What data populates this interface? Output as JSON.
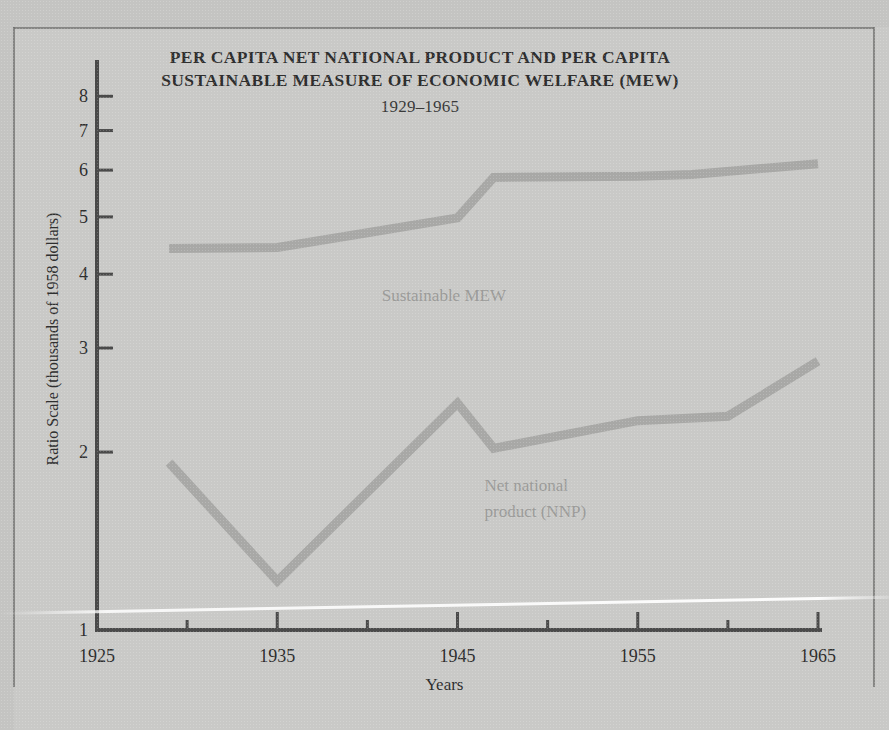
{
  "figure": {
    "title_line1": "PER CAPITA NET NATIONAL PRODUCT AND PER CAPITA",
    "title_line2": "SUSTAINABLE MEASURE OF ECONOMIC WELFARE (MEW)",
    "subtitle": "1929–1965",
    "xlabel": "Years",
    "ylabel": "Ratio Scale (thousands of 1958 dollars)",
    "background_color": "#c9c9c7",
    "axis_color": "#4a4a4a",
    "series_color": "#a8a8a6",
    "text_color": "#2e2e2e"
  },
  "chart_data": {
    "type": "line",
    "title": "PER CAPITA NET NATIONAL PRODUCT AND PER CAPITA SUSTAINABLE MEASURE OF ECONOMIC WELFARE (MEW) 1929–1965",
    "xlabel": "Years",
    "ylabel": "Ratio Scale (thousands of 1958 dollars)",
    "yscale": "log",
    "ylim": [
      1,
      9
    ],
    "xlim": [
      1925,
      1965
    ],
    "grid": false,
    "legend": "inline-annotations",
    "yticks": [
      1,
      2,
      3,
      4,
      5,
      6,
      7,
      8
    ],
    "ytick_labels": [
      "1",
      "2",
      "3",
      "4",
      "5",
      "6",
      "7",
      "8"
    ],
    "xticks": [
      1925,
      1930,
      1935,
      1940,
      1945,
      1950,
      1955,
      1960,
      1965
    ],
    "xtick_labels": [
      "1925",
      "",
      "1935",
      "",
      "1945",
      "",
      "1955",
      "",
      "1965"
    ],
    "xtick_labels_major": [
      "1925",
      "1935",
      "1945",
      "1955",
      "1965"
    ],
    "series": [
      {
        "name": "Sustainable MEW",
        "label_x": 1940.8,
        "label_y": 3.6,
        "x": [
          1929,
          1935,
          1940,
          1945,
          1947,
          1955,
          1958,
          1965
        ],
        "values": [
          4.42,
          4.44,
          4.7,
          4.98,
          5.83,
          5.86,
          5.9,
          6.15
        ]
      },
      {
        "name": "Net national product (NNP)",
        "label_line1": "Net national",
        "label_line2": "product (NNP)",
        "label_x": 1946.5,
        "label_y": 1.72,
        "x": [
          1929,
          1935,
          1945,
          1947,
          1955,
          1960,
          1965
        ],
        "values": [
          1.92,
          1.21,
          2.42,
          2.03,
          2.26,
          2.3,
          2.85
        ]
      }
    ]
  },
  "annotations": {
    "mew_label": "Sustainable MEW",
    "nnp_label_line1": "Net national",
    "nnp_label_line2": "product (NNP)"
  }
}
